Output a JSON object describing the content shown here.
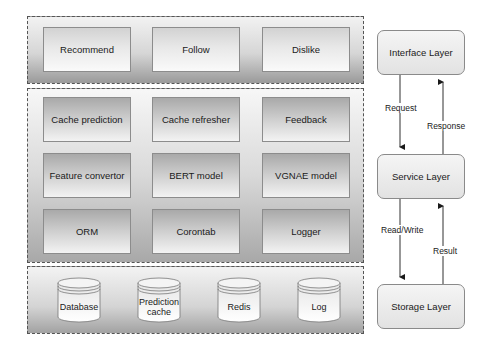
{
  "diagram": {
    "type": "layered-architecture",
    "interface_panel": {
      "modules": [
        "Recommend",
        "Follow",
        "Dislike"
      ]
    },
    "service_panel": {
      "rows": [
        [
          "Cache prediction",
          "Cache refresher",
          "Feedback"
        ],
        [
          "Feature convertor",
          "BERT model",
          "VGNAE model"
        ],
        [
          "ORM",
          "Corontab",
          "Logger"
        ]
      ]
    },
    "storage_panel": {
      "stores": [
        {
          "label_line1": "Database",
          "label_line2": ""
        },
        {
          "label_line1": "Prediction",
          "label_line2": "cache"
        },
        {
          "label_line1": "Redis",
          "label_line2": ""
        },
        {
          "label_line1": "Log",
          "label_line2": ""
        }
      ]
    },
    "layers": {
      "interface": "Interface Layer",
      "service": "Service Layer",
      "storage": "Storage Layer"
    },
    "edges": {
      "request": "Request",
      "response": "Response",
      "read_write": "Read/Write",
      "result": "Result"
    },
    "colors": {
      "border": "#555555",
      "module_border": "#8c8c8c",
      "arrow": "#1a1a1a"
    }
  }
}
